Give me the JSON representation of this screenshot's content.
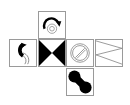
{
  "diagram": {
    "type": "cube-net",
    "faces": [
      {
        "id": "top",
        "position": "row1-col2",
        "pattern": "curved arrow over concentric circles",
        "icon": "curved-arrow-circle-icon"
      },
      {
        "id": "left",
        "position": "row2-col1",
        "pattern": "black and white interlocking S arcs",
        "icon": "s-curve-icon"
      },
      {
        "id": "center",
        "position": "row2-col2",
        "pattern": "black bowtie triangles",
        "icon": "bowtie-icon"
      },
      {
        "id": "right",
        "position": "row2-col3",
        "pattern": "circle with slash (double outline)",
        "icon": "prohibited-circle-icon"
      },
      {
        "id": "far-right",
        "position": "row2-col4",
        "pattern": "zigzag lines",
        "icon": "zigzag-icon"
      },
      {
        "id": "bottom",
        "position": "row3-col3",
        "pattern": "two black circles on diagonal",
        "icon": "two-dots-icon"
      }
    ],
    "colors": {
      "ink": "#000000",
      "border": "#9a9a9a",
      "background": "#ffffff"
    }
  }
}
